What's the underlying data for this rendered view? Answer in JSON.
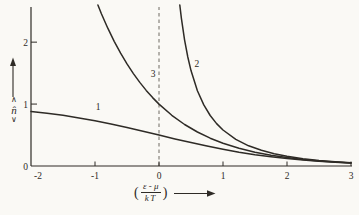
{
  "figure": {
    "background": "#faf9f5",
    "ink": "#2e2b26",
    "dash_color": "#6e6b62"
  },
  "chart_data": {
    "type": "line",
    "title": "",
    "xlabel": "((ε-μ)/kT) →",
    "ylabel": "⟨n̂⟩",
    "xlim": [
      -2,
      3
    ],
    "ylim": [
      0,
      2.6
    ],
    "grid": false,
    "legend": "none",
    "vline": {
      "x": 0,
      "style": "dashed"
    },
    "origin_label": "0",
    "xticks": [
      {
        "v": -2,
        "label": "-2"
      },
      {
        "v": -1,
        "label": "-1"
      },
      {
        "v": 0,
        "label": "0"
      },
      {
        "v": 1,
        "label": "1"
      },
      {
        "v": 2,
        "label": "2"
      },
      {
        "v": 3,
        "label": "3"
      }
    ],
    "yticks": [
      {
        "v": 1,
        "label": "1"
      },
      {
        "v": 2,
        "label": "2"
      }
    ],
    "series": [
      {
        "name": "1",
        "label_at": {
          "x": -0.95,
          "y": 0.9
        },
        "points": [
          [
            -2,
            0.881
          ],
          [
            -1.75,
            0.852
          ],
          [
            -1.5,
            0.818
          ],
          [
            -1.25,
            0.777
          ],
          [
            -1,
            0.731
          ],
          [
            -0.75,
            0.679
          ],
          [
            -0.5,
            0.622
          ],
          [
            -0.25,
            0.562
          ],
          [
            0,
            0.5
          ],
          [
            0.25,
            0.438
          ],
          [
            0.5,
            0.378
          ],
          [
            0.75,
            0.321
          ],
          [
            1,
            0.269
          ],
          [
            1.25,
            0.223
          ],
          [
            1.5,
            0.182
          ],
          [
            1.75,
            0.148
          ],
          [
            2,
            0.119
          ],
          [
            2.25,
            0.095
          ],
          [
            2.5,
            0.076
          ],
          [
            2.75,
            0.06
          ],
          [
            3,
            0.047
          ]
        ]
      },
      {
        "name": "2",
        "label_at": {
          "x": 0.59,
          "y": 1.6
        },
        "points": [
          [
            0.325,
            2.6
          ],
          [
            0.35,
            2.386
          ],
          [
            0.4,
            2.033
          ],
          [
            0.45,
            1.76
          ],
          [
            0.5,
            1.541
          ],
          [
            0.6,
            1.216
          ],
          [
            0.7,
            0.986
          ],
          [
            0.8,
            0.816
          ],
          [
            0.9,
            0.685
          ],
          [
            1,
            0.582
          ],
          [
            1.2,
            0.431
          ],
          [
            1.4,
            0.327
          ],
          [
            1.6,
            0.253
          ],
          [
            1.8,
            0.198
          ],
          [
            2,
            0.156
          ],
          [
            2.25,
            0.118
          ],
          [
            2.5,
            0.089
          ],
          [
            2.75,
            0.068
          ],
          [
            3,
            0.052
          ]
        ]
      },
      {
        "name": "3",
        "label_at": {
          "x": -0.09,
          "y": 1.44
        },
        "points": [
          [
            -0.955,
            2.6
          ],
          [
            -0.9,
            2.46
          ],
          [
            -0.8,
            2.226
          ],
          [
            -0.7,
            2.014
          ],
          [
            -0.6,
            1.822
          ],
          [
            -0.5,
            1.649
          ],
          [
            -0.4,
            1.492
          ],
          [
            -0.3,
            1.35
          ],
          [
            -0.2,
            1.221
          ],
          [
            -0.1,
            1.105
          ],
          [
            0,
            1
          ],
          [
            0.2,
            0.819
          ],
          [
            0.4,
            0.67
          ],
          [
            0.6,
            0.549
          ],
          [
            0.8,
            0.449
          ],
          [
            1,
            0.368
          ],
          [
            1.25,
            0.287
          ],
          [
            1.5,
            0.223
          ],
          [
            1.75,
            0.174
          ],
          [
            2,
            0.135
          ],
          [
            2.25,
            0.105
          ],
          [
            2.5,
            0.082
          ],
          [
            2.75,
            0.064
          ],
          [
            3,
            0.05
          ]
        ]
      }
    ],
    "ylabel_display": {
      "top": "∧",
      "symbol": "n̂",
      "bottom": "∨"
    },
    "xlabel_display": {
      "open": "(",
      "numerator": "ε - μ",
      "denominator": "kT",
      "close": ")"
    }
  }
}
